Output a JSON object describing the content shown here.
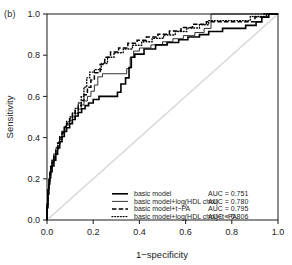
{
  "panel": {
    "label": "(b)"
  },
  "chart_data": {
    "type": "line",
    "title": "",
    "subtitle": "",
    "xlabel": "1−specificity",
    "ylabel": "Sensitivity",
    "xlim": [
      0,
      1
    ],
    "ylim": [
      0,
      1
    ],
    "grid": false,
    "legend_position": "bottom-right",
    "xticks": [
      "0.0",
      "0.2",
      "0.4",
      "0.6",
      "0.8",
      "1.0"
    ],
    "xtick_values": [
      0.0,
      0.2,
      0.4,
      0.6,
      0.8,
      1.0
    ],
    "yticks": [
      "0.0",
      "0.2",
      "0.4",
      "0.6",
      "0.8",
      "1.0"
    ],
    "ytick_values": [
      0.0,
      0.2,
      0.4,
      0.6,
      0.8,
      1.0
    ],
    "reference_line": {
      "name": "chance-diagonal",
      "from": [
        0,
        0
      ],
      "to": [
        1,
        1
      ],
      "color": "#d8d8d8"
    },
    "series": [
      {
        "name": "basic model",
        "auc_label": "AUC = 0.751",
        "auc": 0.751,
        "style": "solid",
        "width": 1.6,
        "color": "#000000",
        "points": [
          [
            0.0,
            0.0
          ],
          [
            0.0,
            0.06
          ],
          [
            0.004,
            0.06
          ],
          [
            0.004,
            0.125
          ],
          [
            0.008,
            0.125
          ],
          [
            0.008,
            0.175
          ],
          [
            0.012,
            0.175
          ],
          [
            0.012,
            0.205
          ],
          [
            0.016,
            0.205
          ],
          [
            0.016,
            0.235
          ],
          [
            0.022,
            0.235
          ],
          [
            0.022,
            0.262
          ],
          [
            0.03,
            0.262
          ],
          [
            0.03,
            0.29
          ],
          [
            0.038,
            0.29
          ],
          [
            0.038,
            0.32
          ],
          [
            0.046,
            0.32
          ],
          [
            0.046,
            0.35
          ],
          [
            0.055,
            0.35
          ],
          [
            0.055,
            0.38
          ],
          [
            0.065,
            0.38
          ],
          [
            0.065,
            0.405
          ],
          [
            0.075,
            0.405
          ],
          [
            0.075,
            0.43
          ],
          [
            0.085,
            0.43
          ],
          [
            0.085,
            0.448
          ],
          [
            0.098,
            0.448
          ],
          [
            0.098,
            0.468
          ],
          [
            0.11,
            0.468
          ],
          [
            0.11,
            0.488
          ],
          [
            0.122,
            0.488
          ],
          [
            0.122,
            0.505
          ],
          [
            0.135,
            0.505
          ],
          [
            0.135,
            0.522
          ],
          [
            0.15,
            0.522
          ],
          [
            0.15,
            0.54
          ],
          [
            0.165,
            0.54
          ],
          [
            0.165,
            0.555
          ],
          [
            0.18,
            0.555
          ],
          [
            0.18,
            0.568
          ],
          [
            0.2,
            0.568
          ],
          [
            0.2,
            0.585
          ],
          [
            0.225,
            0.585
          ],
          [
            0.225,
            0.6
          ],
          [
            0.305,
            0.6
          ],
          [
            0.305,
            0.62
          ],
          [
            0.32,
            0.62
          ],
          [
            0.32,
            0.66
          ],
          [
            0.34,
            0.66
          ],
          [
            0.34,
            0.69
          ],
          [
            0.355,
            0.69
          ],
          [
            0.355,
            0.74
          ],
          [
            0.365,
            0.74
          ],
          [
            0.365,
            0.79
          ],
          [
            0.38,
            0.79
          ],
          [
            0.38,
            0.805
          ],
          [
            0.42,
            0.805
          ],
          [
            0.42,
            0.83
          ],
          [
            0.47,
            0.83
          ],
          [
            0.47,
            0.85
          ],
          [
            0.52,
            0.85
          ],
          [
            0.52,
            0.862
          ],
          [
            0.57,
            0.862
          ],
          [
            0.57,
            0.875
          ],
          [
            0.61,
            0.875
          ],
          [
            0.61,
            0.888
          ],
          [
            0.66,
            0.888
          ],
          [
            0.66,
            0.9
          ],
          [
            0.7,
            0.9
          ],
          [
            0.7,
            0.915
          ],
          [
            0.76,
            0.915
          ],
          [
            0.76,
            0.93
          ],
          [
            0.86,
            0.93
          ],
          [
            0.86,
            0.945
          ],
          [
            0.905,
            0.945
          ],
          [
            0.905,
            0.962
          ],
          [
            0.93,
            0.962
          ],
          [
            0.93,
            0.985
          ],
          [
            0.96,
            0.985
          ],
          [
            0.96,
            1.0
          ],
          [
            1.0,
            1.0
          ]
        ]
      },
      {
        "name": "basic model+log(HDL chol)",
        "auc_label": "AUC = 0.780",
        "auc": 0.78,
        "style": "solid",
        "width": 0.8,
        "color": "#000000",
        "points": [
          [
            0.0,
            0.0
          ],
          [
            0.0,
            0.07
          ],
          [
            0.004,
            0.07
          ],
          [
            0.004,
            0.14
          ],
          [
            0.008,
            0.14
          ],
          [
            0.008,
            0.185
          ],
          [
            0.012,
            0.185
          ],
          [
            0.012,
            0.215
          ],
          [
            0.016,
            0.215
          ],
          [
            0.016,
            0.25
          ],
          [
            0.022,
            0.25
          ],
          [
            0.022,
            0.278
          ],
          [
            0.03,
            0.278
          ],
          [
            0.03,
            0.305
          ],
          [
            0.038,
            0.305
          ],
          [
            0.038,
            0.335
          ],
          [
            0.046,
            0.335
          ],
          [
            0.046,
            0.362
          ],
          [
            0.055,
            0.362
          ],
          [
            0.055,
            0.392
          ],
          [
            0.065,
            0.392
          ],
          [
            0.065,
            0.418
          ],
          [
            0.075,
            0.418
          ],
          [
            0.075,
            0.442
          ],
          [
            0.085,
            0.442
          ],
          [
            0.085,
            0.462
          ],
          [
            0.098,
            0.462
          ],
          [
            0.098,
            0.482
          ],
          [
            0.11,
            0.482
          ],
          [
            0.11,
            0.5
          ],
          [
            0.122,
            0.5
          ],
          [
            0.122,
            0.518
          ],
          [
            0.135,
            0.518
          ],
          [
            0.135,
            0.538
          ],
          [
            0.148,
            0.538
          ],
          [
            0.148,
            0.558
          ],
          [
            0.16,
            0.558
          ],
          [
            0.16,
            0.578
          ],
          [
            0.175,
            0.578
          ],
          [
            0.175,
            0.6
          ],
          [
            0.19,
            0.6
          ],
          [
            0.19,
            0.625
          ],
          [
            0.205,
            0.625
          ],
          [
            0.205,
            0.655
          ],
          [
            0.22,
            0.655
          ],
          [
            0.22,
            0.695
          ],
          [
            0.24,
            0.695
          ],
          [
            0.24,
            0.71
          ],
          [
            0.345,
            0.71
          ],
          [
            0.345,
            0.735
          ],
          [
            0.36,
            0.735
          ],
          [
            0.36,
            0.79
          ],
          [
            0.375,
            0.79
          ],
          [
            0.375,
            0.82
          ],
          [
            0.4,
            0.82
          ],
          [
            0.4,
            0.835
          ],
          [
            0.45,
            0.835
          ],
          [
            0.45,
            0.85
          ],
          [
            0.5,
            0.85
          ],
          [
            0.5,
            0.865
          ],
          [
            0.545,
            0.865
          ],
          [
            0.545,
            0.88
          ],
          [
            0.59,
            0.88
          ],
          [
            0.59,
            0.895
          ],
          [
            0.64,
            0.895
          ],
          [
            0.64,
            0.91
          ],
          [
            0.68,
            0.91
          ],
          [
            0.68,
            0.93
          ],
          [
            0.71,
            0.93
          ],
          [
            0.71,
            1.0
          ],
          [
            1.0,
            1.0
          ]
        ]
      },
      {
        "name": "basic model+t−PA",
        "auc_label": "AUC = 0.795",
        "auc": 0.795,
        "style": "dashed",
        "width": 1.5,
        "color": "#000000",
        "points": [
          [
            0.0,
            0.0
          ],
          [
            0.0,
            0.075
          ],
          [
            0.004,
            0.075
          ],
          [
            0.004,
            0.145
          ],
          [
            0.008,
            0.145
          ],
          [
            0.008,
            0.19
          ],
          [
            0.012,
            0.19
          ],
          [
            0.012,
            0.225
          ],
          [
            0.016,
            0.225
          ],
          [
            0.016,
            0.258
          ],
          [
            0.022,
            0.258
          ],
          [
            0.022,
            0.285
          ],
          [
            0.03,
            0.285
          ],
          [
            0.03,
            0.312
          ],
          [
            0.038,
            0.312
          ],
          [
            0.038,
            0.342
          ],
          [
            0.046,
            0.342
          ],
          [
            0.046,
            0.372
          ],
          [
            0.055,
            0.372
          ],
          [
            0.055,
            0.4
          ],
          [
            0.065,
            0.4
          ],
          [
            0.065,
            0.425
          ],
          [
            0.075,
            0.425
          ],
          [
            0.075,
            0.45
          ],
          [
            0.085,
            0.45
          ],
          [
            0.085,
            0.47
          ],
          [
            0.098,
            0.47
          ],
          [
            0.098,
            0.492
          ],
          [
            0.11,
            0.492
          ],
          [
            0.11,
            0.512
          ],
          [
            0.122,
            0.512
          ],
          [
            0.122,
            0.532
          ],
          [
            0.135,
            0.532
          ],
          [
            0.135,
            0.555
          ],
          [
            0.148,
            0.555
          ],
          [
            0.148,
            0.58
          ],
          [
            0.16,
            0.58
          ],
          [
            0.16,
            0.608
          ],
          [
            0.175,
            0.608
          ],
          [
            0.175,
            0.645
          ],
          [
            0.19,
            0.645
          ],
          [
            0.19,
            0.68
          ],
          [
            0.205,
            0.68
          ],
          [
            0.205,
            0.715
          ],
          [
            0.23,
            0.715
          ],
          [
            0.23,
            0.755
          ],
          [
            0.25,
            0.755
          ],
          [
            0.25,
            0.79
          ],
          [
            0.275,
            0.79
          ],
          [
            0.275,
            0.815
          ],
          [
            0.31,
            0.815
          ],
          [
            0.31,
            0.835
          ],
          [
            0.35,
            0.835
          ],
          [
            0.35,
            0.858
          ],
          [
            0.39,
            0.858
          ],
          [
            0.39,
            0.872
          ],
          [
            0.43,
            0.872
          ],
          [
            0.43,
            0.888
          ],
          [
            0.48,
            0.888
          ],
          [
            0.48,
            0.902
          ],
          [
            0.53,
            0.902
          ],
          [
            0.53,
            0.918
          ],
          [
            0.58,
            0.918
          ],
          [
            0.58,
            0.935
          ],
          [
            0.63,
            0.935
          ],
          [
            0.63,
            0.95
          ],
          [
            0.69,
            0.95
          ],
          [
            0.69,
            0.962
          ],
          [
            0.9,
            0.962
          ],
          [
            0.9,
            0.985
          ],
          [
            0.95,
            0.985
          ],
          [
            0.95,
            1.0
          ],
          [
            1.0,
            1.0
          ]
        ]
      },
      {
        "name": "basic model+log(HDL chol)+t−PA",
        "auc_label": "AUC = 0.806",
        "auc": 0.806,
        "style": "dotted",
        "width": 1.4,
        "color": "#000000",
        "points": [
          [
            0.0,
            0.0
          ],
          [
            0.0,
            0.08
          ],
          [
            0.004,
            0.08
          ],
          [
            0.004,
            0.15
          ],
          [
            0.008,
            0.15
          ],
          [
            0.008,
            0.198
          ],
          [
            0.012,
            0.198
          ],
          [
            0.012,
            0.232
          ],
          [
            0.016,
            0.232
          ],
          [
            0.016,
            0.265
          ],
          [
            0.022,
            0.265
          ],
          [
            0.022,
            0.292
          ],
          [
            0.03,
            0.292
          ],
          [
            0.03,
            0.32
          ],
          [
            0.038,
            0.32
          ],
          [
            0.038,
            0.35
          ],
          [
            0.046,
            0.35
          ],
          [
            0.046,
            0.378
          ],
          [
            0.055,
            0.378
          ],
          [
            0.055,
            0.405
          ],
          [
            0.065,
            0.405
          ],
          [
            0.065,
            0.43
          ],
          [
            0.075,
            0.43
          ],
          [
            0.075,
            0.455
          ],
          [
            0.085,
            0.455
          ],
          [
            0.085,
            0.478
          ],
          [
            0.098,
            0.478
          ],
          [
            0.098,
            0.5
          ],
          [
            0.11,
            0.5
          ],
          [
            0.11,
            0.52
          ],
          [
            0.122,
            0.52
          ],
          [
            0.122,
            0.542
          ],
          [
            0.135,
            0.542
          ],
          [
            0.135,
            0.568
          ],
          [
            0.148,
            0.568
          ],
          [
            0.148,
            0.598
          ],
          [
            0.16,
            0.598
          ],
          [
            0.16,
            0.645
          ],
          [
            0.172,
            0.645
          ],
          [
            0.172,
            0.69
          ],
          [
            0.185,
            0.69
          ],
          [
            0.185,
            0.718
          ],
          [
            0.205,
            0.718
          ],
          [
            0.205,
            0.73
          ],
          [
            0.235,
            0.73
          ],
          [
            0.235,
            0.76
          ],
          [
            0.262,
            0.76
          ],
          [
            0.262,
            0.79
          ],
          [
            0.29,
            0.79
          ],
          [
            0.29,
            0.812
          ],
          [
            0.33,
            0.812
          ],
          [
            0.33,
            0.83
          ],
          [
            0.37,
            0.83
          ],
          [
            0.37,
            0.848
          ],
          [
            0.41,
            0.848
          ],
          [
            0.41,
            0.865
          ],
          [
            0.455,
            0.865
          ],
          [
            0.455,
            0.882
          ],
          [
            0.505,
            0.882
          ],
          [
            0.505,
            0.898
          ],
          [
            0.555,
            0.898
          ],
          [
            0.555,
            0.915
          ],
          [
            0.605,
            0.915
          ],
          [
            0.605,
            0.932
          ],
          [
            0.66,
            0.932
          ],
          [
            0.66,
            0.948
          ],
          [
            0.7,
            0.948
          ],
          [
            0.7,
            0.968
          ],
          [
            0.88,
            0.968
          ],
          [
            0.88,
            0.988
          ],
          [
            0.94,
            0.988
          ],
          [
            0.94,
            1.0
          ],
          [
            1.0,
            1.0
          ]
        ]
      }
    ]
  }
}
